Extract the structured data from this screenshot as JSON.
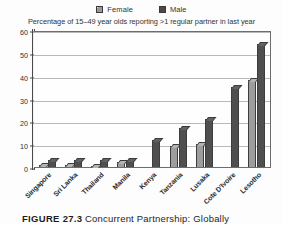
{
  "legend": {
    "position": "top-center",
    "entries": [
      {
        "label": "Female",
        "icon": "legend-swatch-female",
        "color": "#9d9d9d"
      },
      {
        "label": "Male",
        "icon": "legend-swatch-male",
        "color": "#4f4f4f"
      }
    ]
  },
  "caption": {
    "number": "FIGURE 27.3",
    "text": "Concurrent Partnership: Globally"
  },
  "chart_data": {
    "type": "bar",
    "title": "Percentage of 15–49 year olds reporting >1 regular partner in last year",
    "xlabel": "",
    "ylabel": "",
    "ylim": [
      0,
      60
    ],
    "yticks": [
      0,
      10,
      20,
      30,
      40,
      50,
      60
    ],
    "ytick_labels": [
      "0",
      "10",
      "20",
      "30",
      "40",
      "50",
      "60"
    ],
    "grid": true,
    "legend_position": "top-center",
    "categories": [
      "Singapore",
      "Sri Lanka",
      "Thailand",
      "Manila",
      "Kenya",
      "Tanzania",
      "Lusaka",
      "Cote D'Ivoire",
      "Lesotho"
    ],
    "series": [
      {
        "name": "Female",
        "color": "#9d9d9d",
        "values": [
          1,
          1,
          0.5,
          2,
          0,
          9,
          10,
          0,
          38
        ]
      },
      {
        "name": "Male",
        "color": "#4f4f4f",
        "values": [
          3,
          3,
          3,
          3,
          12,
          17,
          21,
          35,
          54
        ]
      }
    ]
  }
}
